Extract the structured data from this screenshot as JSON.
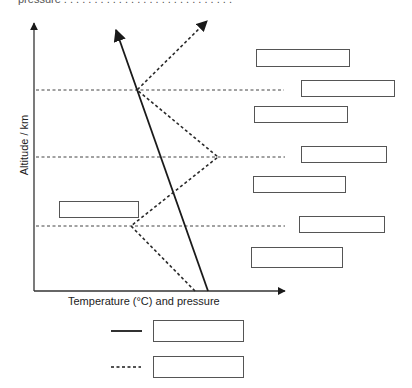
{
  "header": {
    "cropped_text": "pressure . . . . . . . . . . . . . . . . . . . . . . . . . . . ."
  },
  "diagram": {
    "y_axis": {
      "label": "Altitude / km",
      "x": 34,
      "top": 23,
      "bottom": 291
    },
    "x_axis": {
      "label": "Temperature (°C) and pressure",
      "y": 291,
      "left": 34,
      "right": 285
    },
    "boundary_lines": [
      {
        "name": "upper-boundary",
        "y": 90,
        "x1": 36,
        "x2": 284
      },
      {
        "name": "middle-boundary",
        "y": 157,
        "x1": 36,
        "x2": 285
      },
      {
        "name": "lower-boundary",
        "y": 226,
        "x1": 36,
        "x2": 285
      }
    ],
    "pressure_line": {
      "style": "solid",
      "points": [
        [
          208,
          291
        ],
        [
          116,
          30
        ]
      ]
    },
    "temperature_line": {
      "style": "dashed",
      "points": [
        [
          195,
          291
        ],
        [
          131,
          226
        ],
        [
          218,
          157
        ],
        [
          137,
          90
        ],
        [
          207,
          21
        ]
      ]
    },
    "label_boxes": [
      {
        "name": "answer-box-1",
        "x": 256,
        "y": 49,
        "w": 94,
        "h": 18,
        "text": ""
      },
      {
        "name": "answer-box-2",
        "x": 301,
        "y": 80,
        "w": 94,
        "h": 17,
        "text": ""
      },
      {
        "name": "answer-box-3",
        "x": 254,
        "y": 106,
        "w": 94,
        "h": 17,
        "text": ""
      },
      {
        "name": "answer-box-4",
        "x": 301,
        "y": 146,
        "w": 86,
        "h": 17,
        "text": ""
      },
      {
        "name": "answer-box-5",
        "x": 253,
        "y": 176,
        "w": 93,
        "h": 17,
        "text": ""
      },
      {
        "name": "answer-box-6",
        "x": 299,
        "y": 216,
        "w": 86,
        "h": 17,
        "text": ""
      },
      {
        "name": "answer-box-7",
        "x": 251,
        "y": 247,
        "w": 92,
        "h": 21,
        "text": ""
      },
      {
        "name": "answer-box-left",
        "x": 59,
        "y": 201,
        "w": 80,
        "h": 17,
        "text": ""
      }
    ],
    "legend": [
      {
        "style": "solid",
        "line": {
          "x1": 111,
          "x2": 142,
          "y": 331
        },
        "box": {
          "x": 153,
          "y": 320,
          "w": 91,
          "h": 22
        },
        "text": ""
      },
      {
        "style": "dashed",
        "line": {
          "x1": 111,
          "x2": 141,
          "y": 367
        },
        "box": {
          "x": 153,
          "y": 356,
          "w": 91,
          "h": 22
        },
        "text": ""
      }
    ],
    "colors": {
      "line": "#1a1a1a",
      "dashed": "#2a2a2a",
      "box_border": "#555555",
      "background": "#ffffff"
    }
  }
}
